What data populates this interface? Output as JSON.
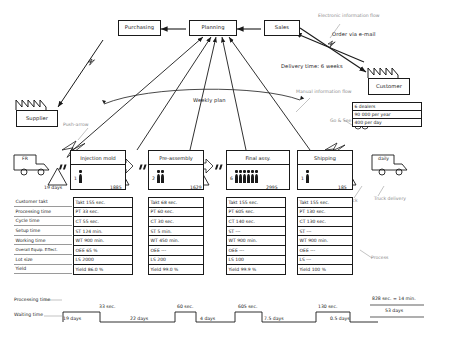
{
  "top_boxes": {
    "purchasing": "Purchasing",
    "planning": "Planning",
    "sales": "Sales"
  },
  "entities": {
    "supplier": "Supplier",
    "customer": "Customer"
  },
  "annotations": {
    "electronic_information_flow": "Electronic information flow",
    "order_via_email": "Order via e-mail",
    "delivery_time": "Delivery time: 6 weeks",
    "manual_information_flow": "Manual information flow",
    "weekly_plan": "Weekly plan",
    "go_and_see": "Go & See",
    "push_arrow": "Push-arrow",
    "truck_delivery": "Truck delivery",
    "stock": "Stock",
    "process": "Process",
    "truck_inbound": "FR",
    "truck_outbound": "daily"
  },
  "customer_demand": {
    "rows": [
      "6 dealers",
      "90 000 per year",
      "400 per day"
    ]
  },
  "processes": [
    {
      "name": "Injection mold",
      "operators": "1",
      "worker_count": 1
    },
    {
      "name": "Pre-assembly",
      "operators": "2",
      "worker_count": 2
    },
    {
      "name": "Final assy.",
      "operators": "6",
      "worker_count": 6
    },
    {
      "name": "Shipping",
      "operators": "1",
      "worker_count": 1
    }
  ],
  "inventories": [
    {
      "value": "19 days"
    },
    {
      "value": "1885"
    },
    {
      "value": "1629"
    },
    {
      "value": "2995"
    },
    {
      "value": "185"
    }
  ],
  "data_box": {
    "row_labels": [
      "Customer takt",
      "Processing time",
      "Cycle time",
      "Setup time",
      "Working time",
      "Overall Equip. Effect.",
      "Lot size",
      "Yield"
    ],
    "columns": [
      [
        "Takt 155 sec.",
        "PT    33 sec.",
        "CT    55 sec.",
        "ST    124 min.",
        "WT   900 min.",
        "OEE  65 %",
        "LS 2000",
        "Yield 86.0 %"
      ],
      [
        "Takt 68 sec.",
        "PT    60 sec.",
        "CT    30 sec.",
        "ST    5 min.",
        "WT   450 min.",
        "OEE   ---",
        "LS 200",
        "Yield 99.0 %"
      ],
      [
        "Takt 155 sec.",
        "PT   605 sec.",
        "CT   140 sec.",
        "ST     ---",
        "WT   900 min.",
        "OEE   ---",
        "LS 100",
        "Yield 99.9 %"
      ],
      [
        "Takt 155 sec.",
        "PT   130 sec.",
        "CT   130 sec.",
        "ST     ---",
        "WT   900 min.",
        "OEE   ---",
        "LS   ---",
        "Yield 100 %"
      ]
    ]
  },
  "timeline": {
    "processing_label": "Processing time",
    "waiting_label": "Waiting time",
    "processing_values": [
      "33 sec.",
      "60 sec.",
      "605 sec.",
      "130 sec."
    ],
    "waiting_values": [
      "19 days",
      "22 days",
      "4 days",
      "7.5 days",
      "0.5 days"
    ],
    "total_processing": "828 sec. = 14 min.",
    "total_waiting": "53 days"
  }
}
